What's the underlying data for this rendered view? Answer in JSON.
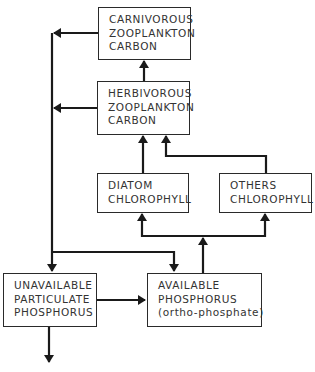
{
  "diagram": {
    "title": "",
    "nodes": {
      "carnivorous": {
        "lines": [
          "CARNIVOROUS",
          "ZOOPLANKTON",
          "CARBON"
        ]
      },
      "herbivorous": {
        "lines": [
          "HERBIVOROUS",
          "ZOOPLANKTON",
          "CARBON"
        ]
      },
      "diatom": {
        "lines": [
          "DIATOM",
          "CHLOROPHYLL"
        ]
      },
      "others": {
        "lines": [
          "OTHERS",
          "CHLOROPHYLL"
        ]
      },
      "unavailable": {
        "lines": [
          "UNAVAILABLE",
          "PARTICULATE",
          "PHOSPHORUS"
        ]
      },
      "available": {
        "lines": [
          "AVAILABLE",
          "PHOSPHORUS",
          "(ortho-phosphate)"
        ]
      }
    },
    "edges": [
      {
        "from": "herbivorous",
        "to": "carnivorous"
      },
      {
        "from": "diatom",
        "to": "herbivorous"
      },
      {
        "from": "others",
        "to": "herbivorous"
      },
      {
        "from": "available",
        "to": "diatom"
      },
      {
        "from": "available",
        "to": "others"
      },
      {
        "from": "carnivorous",
        "to": "unavailable"
      },
      {
        "from": "herbivorous",
        "to": "unavailable"
      },
      {
        "from": "carnivorous",
        "to": "available"
      },
      {
        "from": "herbivorous",
        "to": "available"
      },
      {
        "from": "unavailable",
        "to": "available"
      },
      {
        "from": "unavailable",
        "to": "sink"
      }
    ],
    "colors": {
      "line": "#1a1a1a",
      "text": "#333333",
      "background": "#ffffff"
    }
  }
}
